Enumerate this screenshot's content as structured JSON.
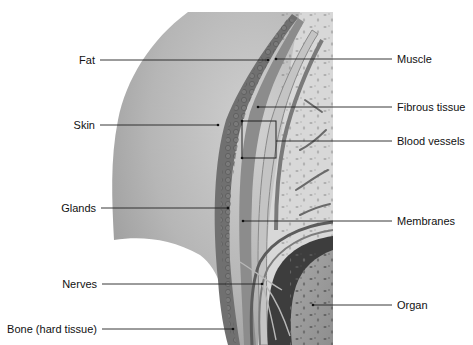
{
  "diagram": {
    "type": "anatomical-cross-section",
    "labels_left": [
      {
        "id": "fat",
        "text": "Fat",
        "y": 60,
        "text_right_x": 95,
        "line_start_x": 100,
        "line_end_x": 268
      },
      {
        "id": "skin",
        "text": "Skin",
        "y": 125,
        "text_right_x": 95,
        "line_start_x": 100,
        "line_end_x": 218
      },
      {
        "id": "glands",
        "text": "Glands",
        "y": 208,
        "text_right_x": 96,
        "line_start_x": 101,
        "line_end_x": 228
      },
      {
        "id": "nerves",
        "text": "Nerves",
        "y": 284,
        "text_right_x": 97,
        "line_start_x": 102,
        "line_end_x": 262
      },
      {
        "id": "bone",
        "text": "Bone (hard tissue)",
        "y": 329,
        "text_right_x": 97,
        "line_start_x": 102,
        "line_end_x": 233
      }
    ],
    "labels_right": [
      {
        "id": "muscle",
        "text": "Muscle",
        "y": 59,
        "text_left_x": 397,
        "line_start_x": 276,
        "line_end_x": 392
      },
      {
        "id": "fibrous-tissue",
        "text": "Fibrous tissue",
        "y": 107,
        "text_left_x": 397,
        "line_start_x": 258,
        "line_end_x": 392
      },
      {
        "id": "blood-vessels",
        "text": "Blood vessels",
        "y": 141,
        "text_left_x": 397,
        "line_start_x": 276,
        "line_end_x": 392
      },
      {
        "id": "membranes",
        "text": "Membranes",
        "y": 221,
        "text_left_x": 397,
        "line_start_x": 243,
        "line_end_x": 392
      },
      {
        "id": "organ",
        "text": "Organ",
        "y": 305,
        "text_left_x": 397,
        "line_start_x": 313,
        "line_end_x": 392
      }
    ],
    "bracket": {
      "target": "blood-vessels",
      "x1": 242,
      "y1": 121,
      "x2": 276,
      "y2": 158
    },
    "colors": {
      "background": "#ffffff",
      "body_surface": "#b9b9b9",
      "body_shadow": "#8f8f8f",
      "skin_layer": "#6f6f6f",
      "muscle": "#8a8a8a",
      "fibrous_tissue": "#c6c6c6",
      "interior": "#d8d8d8",
      "organ_wall": "#3d3d3d",
      "organ": "#9d9d9d",
      "leader_line": "#222222",
      "label_text": "#111111"
    }
  }
}
